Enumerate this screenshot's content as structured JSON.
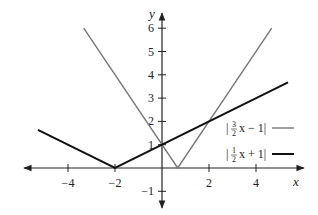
{
  "chart_data": {
    "type": "line",
    "title": "",
    "xlabel": "x",
    "ylabel": "y",
    "xlim": [
      -5.5,
      6
    ],
    "ylim": [
      -1.7,
      6.5
    ],
    "grid": false,
    "legend_position": "right-middle",
    "x_ticks": [
      -4,
      -2,
      2,
      4
    ],
    "x_tick_labels": [
      "−4",
      "−2",
      "2",
      "4"
    ],
    "y_ticks": [
      -1,
      1,
      2,
      3,
      4,
      5,
      6
    ],
    "y_tick_labels": [
      "−1",
      "1",
      "2",
      "3",
      "4",
      "5",
      "6"
    ],
    "series": [
      {
        "name": "|3/2 x − 1|",
        "color": "#777777",
        "x": [
          -3.33,
          0.667,
          4.67
        ],
        "y": [
          6,
          0,
          6
        ]
      },
      {
        "name": "|1/2 x + 1|",
        "color": "#111111",
        "x": [
          -5.28,
          -2,
          5.36
        ],
        "y": [
          1.64,
          0,
          3.68
        ]
      }
    ],
    "annotations": []
  },
  "legend": {
    "items": [
      {
        "prefix": "|",
        "num": "3",
        "den": "2",
        "suffix": "x − 1|",
        "color": "#777777"
      },
      {
        "prefix": "|",
        "num": "1",
        "den": "2",
        "suffix": "x + 1|",
        "color": "#111111"
      }
    ]
  },
  "axes": {
    "x_label": "x",
    "y_label": "y"
  }
}
